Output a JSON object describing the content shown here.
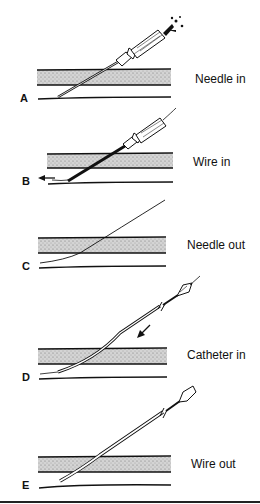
{
  "diagram": {
    "type": "procedure-steps",
    "panels": [
      {
        "letter": "A",
        "label": "Needle in"
      },
      {
        "letter": "B",
        "label": "Wire in"
      },
      {
        "letter": "C",
        "label": "Needle out"
      },
      {
        "letter": "D",
        "label": "Catheter in"
      },
      {
        "letter": "E",
        "label": "Wire out"
      }
    ]
  },
  "colors": {
    "ink": "#111111",
    "tissue": "#c8c8c8",
    "background": "#ffffff"
  }
}
